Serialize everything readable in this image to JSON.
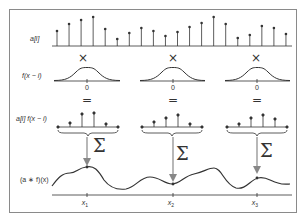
{
  "diagram": {
    "rows": {
      "signal_label": "a[i]",
      "kernel_label": "f(x − i)",
      "product_label": "a[i] f(x − i)",
      "result_label": "(a ∗ f)(x)"
    },
    "operators": {
      "multiply": "×",
      "equals": "=",
      "sum": "Σ"
    },
    "kernel_origin_label": "0",
    "sample_points": [
      "x1",
      "x2",
      "x3"
    ],
    "sample_point_labels": {
      "x1_main": "x",
      "x1_sub": "1",
      "x2_main": "x",
      "x2_sub": "2",
      "x3_main": "x",
      "x3_sub": "3"
    },
    "colors": {
      "line": "#333333",
      "arrow": "#888888",
      "frame": "#8a8a8a"
    },
    "signal_stems": {
      "x_start": 57,
      "spacing": 12.05,
      "baseline_y": 46,
      "tops_y": [
        31,
        24,
        20,
        17,
        29,
        39,
        33,
        28,
        31,
        36,
        32,
        27,
        23,
        17,
        24,
        38,
        35,
        26,
        28,
        34
      ]
    }
  }
}
